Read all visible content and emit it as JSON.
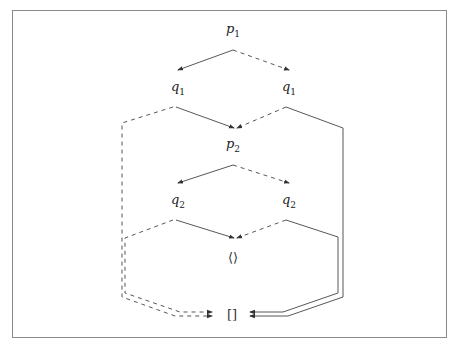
{
  "diagram": {
    "type": "commutative-diagram",
    "nodes": {
      "p1": {
        "base": "p",
        "sub": "1"
      },
      "q1_left": {
        "base": "q",
        "sub": "1"
      },
      "q1_right": {
        "base": "q",
        "sub": "1"
      },
      "p2": {
        "base": "p",
        "sub": "2"
      },
      "q2_left": {
        "base": "q",
        "sub": "2"
      },
      "q2_right": {
        "base": "q",
        "sub": "2"
      },
      "tuple": {
        "label": "⟨⟩"
      },
      "list": {
        "label": "[]"
      }
    },
    "edges": [
      {
        "from": "p1",
        "to": "q1_left",
        "style": "solid"
      },
      {
        "from": "p1",
        "to": "q1_right",
        "style": "dashed"
      },
      {
        "from": "q1_left",
        "to": "p2",
        "style": "solid"
      },
      {
        "from": "q1_right",
        "to": "p2",
        "style": "dashed"
      },
      {
        "from": "q1_left",
        "to": "list",
        "style": "dashed"
      },
      {
        "from": "q1_right",
        "to": "list",
        "style": "solid"
      },
      {
        "from": "p2",
        "to": "q2_left",
        "style": "solid"
      },
      {
        "from": "p2",
        "to": "q2_right",
        "style": "dashed"
      },
      {
        "from": "q2_left",
        "to": "tuple",
        "style": "solid"
      },
      {
        "from": "q2_right",
        "to": "tuple",
        "style": "dashed"
      },
      {
        "from": "q2_left",
        "to": "list",
        "style": "dashed"
      },
      {
        "from": "q2_right",
        "to": "list",
        "style": "solid"
      }
    ],
    "colors": {
      "line": "#444444",
      "frame": "#8a8a8a",
      "text": "#222222"
    }
  }
}
